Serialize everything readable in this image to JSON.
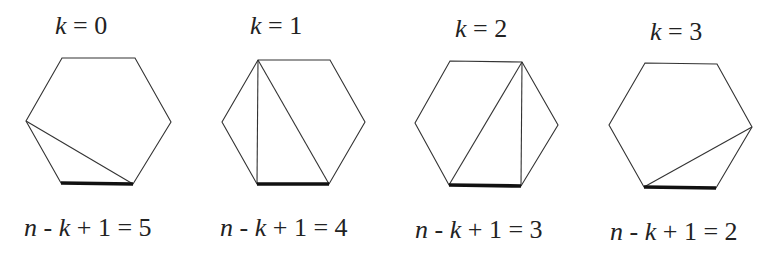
{
  "figure": {
    "panels": [
      {
        "k_label": {
          "var": "k",
          "eq": " = ",
          "val": "0"
        },
        "formula": {
          "n": "n",
          "minus": " - ",
          "k": "k",
          "rest": " + 1 = ",
          "val": "5"
        },
        "vertices": [
          [
            62,
            58
          ],
          [
            135,
            58
          ],
          [
            171,
            122
          ],
          [
            133,
            184
          ],
          [
            61,
            183
          ],
          [
            26,
            121
          ]
        ],
        "base": [
          [
            61,
            183
          ],
          [
            133,
            184
          ]
        ],
        "diagonals": [
          [
            [
              26,
              121
            ],
            [
              133,
              184
            ]
          ]
        ]
      },
      {
        "k_label": {
          "var": "k",
          "eq": " = ",
          "val": "1"
        },
        "formula": {
          "n": "n",
          "minus": " - ",
          "k": "k",
          "rest": " + 1 = ",
          "val": "4"
        },
        "vertices": [
          [
            258,
            60
          ],
          [
            330,
            60
          ],
          [
            365,
            122
          ],
          [
            329,
            184
          ],
          [
            257,
            184
          ],
          [
            222,
            122
          ]
        ],
        "base": [
          [
            257,
            184
          ],
          [
            329,
            184
          ]
        ],
        "diagonals": [
          [
            [
              258,
              60
            ],
            [
              257,
              184
            ]
          ],
          [
            [
              258,
              60
            ],
            [
              329,
              184
            ]
          ]
        ]
      },
      {
        "k_label": {
          "var": "k",
          "eq": " = ",
          "val": "2"
        },
        "formula": {
          "n": "n",
          "minus": " - ",
          "k": "k",
          "rest": " + 1 = ",
          "val": "3"
        },
        "vertices": [
          [
            450,
            61
          ],
          [
            522,
            62
          ],
          [
            558,
            125
          ],
          [
            521,
            186
          ],
          [
            449,
            185
          ],
          [
            415,
            123
          ]
        ],
        "base": [
          [
            449,
            185
          ],
          [
            521,
            186
          ]
        ],
        "diagonals": [
          [
            [
              522,
              62
            ],
            [
              449,
              185
            ]
          ],
          [
            [
              522,
              62
            ],
            [
              521,
              186
            ]
          ]
        ]
      },
      {
        "k_label": {
          "var": "k",
          "eq": " = ",
          "val": "3"
        },
        "formula": {
          "n": "n",
          "minus": " - ",
          "k": "k",
          "rest": " + 1 = ",
          "val": "2"
        },
        "vertices": [
          [
            645,
            63
          ],
          [
            717,
            64
          ],
          [
            752,
            127
          ],
          [
            716,
            188
          ],
          [
            644,
            187
          ],
          [
            609,
            125
          ]
        ],
        "base": [
          [
            644,
            187
          ],
          [
            716,
            188
          ]
        ],
        "diagonals": [
          [
            [
              752,
              127
            ],
            [
              644,
              187
            ]
          ]
        ]
      }
    ]
  },
  "colors": {
    "stroke": "#333333",
    "base": "#111111",
    "text": "#222222",
    "background": "#ffffff"
  }
}
